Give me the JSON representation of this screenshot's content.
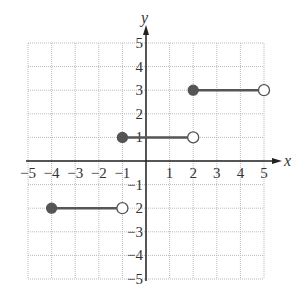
{
  "chart_data": {
    "type": "line",
    "title": "",
    "xlabel": "x",
    "ylabel": "y",
    "xlim": [
      -5,
      5
    ],
    "ylim": [
      -5,
      5
    ],
    "grid": true,
    "x_ticks": [
      "−5",
      "−4",
      "−3",
      "−2",
      "−1",
      "1",
      "2",
      "3",
      "4",
      "5"
    ],
    "y_ticks": [
      "5",
      "4",
      "3",
      "2",
      "1",
      "−1",
      "2",
      "−3",
      "−4",
      "−5"
    ],
    "series": [
      {
        "name": "segment-1",
        "x": [
          -4,
          -1
        ],
        "y": [
          -2,
          -2
        ],
        "start": "closed",
        "end": "open"
      },
      {
        "name": "segment-2",
        "x": [
          -1,
          2
        ],
        "y": [
          1,
          1
        ],
        "start": "closed",
        "end": "open"
      },
      {
        "name": "segment-3",
        "x": [
          2,
          5
        ],
        "y": [
          3,
          3
        ],
        "start": "closed",
        "end": "open"
      }
    ],
    "colors": {
      "line": "#555555",
      "grid": "#bbbbbb",
      "axis": "#222222"
    }
  }
}
